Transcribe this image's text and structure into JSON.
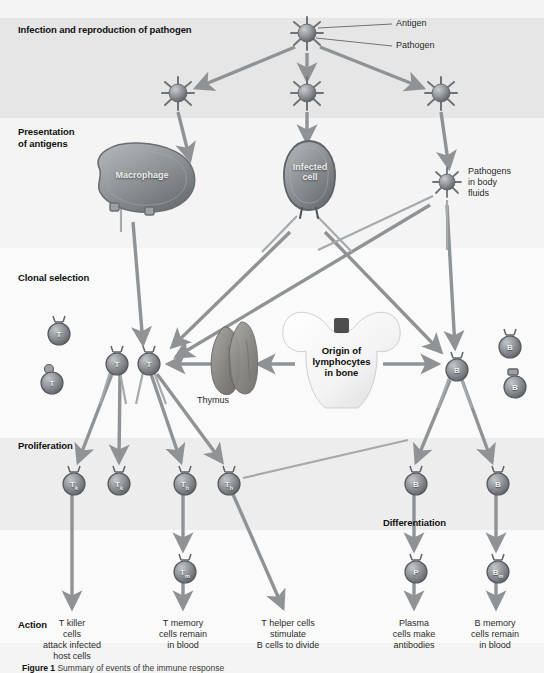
{
  "figure": {
    "caption_prefix": "Figure 1",
    "caption_text": "Summary of events of the immune response"
  },
  "colors": {
    "band_dark": "#e6e6e6",
    "band_mid": "#ededed",
    "band_light": "#f4f4f4",
    "band_pale": "#fafafa",
    "arrow": "#8f9396",
    "connector": "#a6aaad",
    "cell_fill": "#8d9195",
    "cell_dark": "#5f6468",
    "text": "#111111"
  },
  "stages": [
    {
      "id": "infection",
      "label": "Infection and reproduction of pathogen"
    },
    {
      "id": "presentation",
      "label": "Presentation\nof antigens"
    },
    {
      "id": "clonal",
      "label": "Clonal selection"
    },
    {
      "id": "proliferation",
      "label": "Proliferation"
    },
    {
      "id": "differentiation",
      "label": "Differentiation"
    },
    {
      "id": "action",
      "label": "Action"
    }
  ],
  "callouts": {
    "antigen": "Antigen",
    "pathogen": "Pathogen",
    "pathogens_body_fluids": "Pathogens\nin body\nfluids",
    "thymus": "Thymus",
    "bone": "Origin of\nlymphocytes\nin bone"
  },
  "big_cells": [
    {
      "id": "macrophage",
      "label": "Macrophage"
    },
    {
      "id": "infected-cell",
      "label": "Infected\ncell"
    }
  ],
  "pathogens": [
    {
      "id": "pathogen-parent",
      "x": 307,
      "y": 33
    },
    {
      "id": "pathogen-left",
      "x": 178,
      "y": 93
    },
    {
      "id": "pathogen-mid",
      "x": 307,
      "y": 93
    },
    {
      "id": "pathogen-right",
      "x": 441,
      "y": 93
    },
    {
      "id": "pathogen-fluid",
      "x": 447,
      "y": 182
    }
  ],
  "cells": {
    "clonal_t_naive": [
      {
        "id": "t-naive-1",
        "label": "T",
        "sub": "",
        "x": 57,
        "y": 327,
        "r": 13
      },
      {
        "id": "t-naive-2",
        "label": "T",
        "sub": "",
        "x": 50,
        "y": 375,
        "r": 13
      }
    ],
    "clonal_t_selected": [
      {
        "id": "t-selected-1",
        "label": "T",
        "sub": "",
        "x": 115,
        "y": 357,
        "r": 13
      },
      {
        "id": "t-selected-2",
        "label": "T",
        "sub": "",
        "x": 147,
        "y": 357,
        "r": 13
      }
    ],
    "clonal_b": [
      {
        "id": "b-naive-1",
        "label": "B",
        "sub": "",
        "x": 508,
        "y": 340,
        "r": 13
      },
      {
        "id": "b-selected",
        "label": "B",
        "sub": "",
        "x": 455,
        "y": 363,
        "r": 13
      },
      {
        "id": "b-naive-2",
        "label": "B",
        "sub": "",
        "x": 513,
        "y": 380,
        "r": 13
      }
    ],
    "proliferation": [
      {
        "id": "prolif-tk-1",
        "label": "T",
        "sub": "k",
        "x": 72,
        "y": 477,
        "r": 13
      },
      {
        "id": "prolif-tk-2",
        "label": "T",
        "sub": "k",
        "x": 117,
        "y": 477,
        "r": 13
      },
      {
        "id": "prolif-th-1",
        "label": "T",
        "sub": "h",
        "x": 183,
        "y": 477,
        "r": 13
      },
      {
        "id": "prolif-th-2",
        "label": "T",
        "sub": "h",
        "x": 227,
        "y": 477,
        "r": 13
      },
      {
        "id": "prolif-b-1",
        "label": "B",
        "sub": "",
        "x": 414,
        "y": 477,
        "r": 13
      },
      {
        "id": "prolif-b-2",
        "label": "B",
        "sub": "",
        "x": 496,
        "y": 477,
        "r": 13
      }
    ],
    "effector": [
      {
        "id": "t-memory",
        "label": "T",
        "sub": "m",
        "x": 183,
        "y": 565,
        "r": 13
      },
      {
        "id": "plasma",
        "label": "P",
        "sub": "",
        "x": 414,
        "y": 565,
        "r": 13
      },
      {
        "id": "b-memory",
        "label": "B",
        "sub": "m",
        "x": 496,
        "y": 565,
        "r": 13
      }
    ]
  },
  "action_labels": [
    {
      "id": "action-t-killer",
      "text": "T killer\ncells\nattack infected\nhost cells",
      "x": 72,
      "y": 620
    },
    {
      "id": "action-t-memory",
      "text": "T memory\ncells remain\nin blood",
      "x": 183,
      "y": 620
    },
    {
      "id": "action-t-helper",
      "text": "T helper cells\nstimulate\nB cells to divide",
      "x": 287,
      "y": 620
    },
    {
      "id": "action-plasma",
      "text": "Plasma\ncells make\nantibodies",
      "x": 414,
      "y": 620
    },
    {
      "id": "action-b-memory",
      "text": "B memory\ncells remain\nin blood",
      "x": 496,
      "y": 620
    }
  ]
}
